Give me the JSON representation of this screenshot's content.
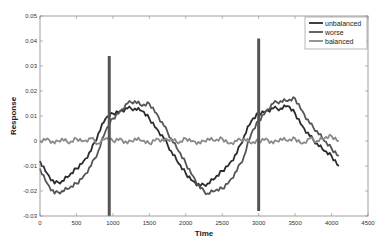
{
  "chart_data": {
    "type": "line",
    "title": "",
    "xlabel": "Time",
    "ylabel": "Response",
    "xlim": [
      0,
      4500
    ],
    "ylim": [
      -0.03,
      0.05
    ],
    "x_ticks": [
      0,
      500,
      1000,
      1500,
      2000,
      2500,
      3000,
      3500,
      4000,
      4500
    ],
    "y_ticks": [
      -0.03,
      -0.02,
      -0.01,
      0,
      0.01,
      0.02,
      0.03,
      0.04,
      0.05
    ],
    "x_tick_labels": [
      "0",
      "500",
      "1000",
      "1500",
      "2000",
      "2500",
      "3000",
      "3500",
      "4000",
      "4500"
    ],
    "y_tick_labels": [
      "-0.03",
      "-0.02",
      "-0.01",
      "0",
      "0.01",
      "0.02",
      "0.03",
      "0.04",
      "0.05"
    ],
    "grid": false,
    "legend_position": "upper right",
    "series": [
      {
        "name": "unbalanced",
        "color": "#2b2b2b",
        "x": [
          0,
          100,
          200,
          300,
          400,
          500,
          600,
          700,
          800,
          900,
          1000,
          1100,
          1200,
          1300,
          1400,
          1500,
          1600,
          1700,
          1800,
          1900,
          2000,
          2100,
          2200,
          2300,
          2400,
          2500,
          2600,
          2700,
          2800,
          2900,
          3000,
          3100,
          3200,
          3300,
          3400,
          3500,
          3600,
          3700,
          3800,
          3900,
          4000,
          4100
        ],
        "y": [
          -0.008,
          -0.013,
          -0.017,
          -0.016,
          -0.014,
          -0.011,
          -0.008,
          -0.004,
          0.003,
          0.009,
          0.011,
          0.012,
          0.013,
          0.013,
          0.012,
          0.009,
          0.005,
          0.001,
          -0.004,
          -0.009,
          -0.013,
          -0.016,
          -0.018,
          -0.017,
          -0.015,
          -0.012,
          -0.009,
          -0.005,
          0.002,
          0.008,
          0.011,
          0.012,
          0.013,
          0.013,
          0.014,
          0.011,
          0.006,
          0.002,
          -0.001,
          -0.004,
          -0.006,
          -0.01
        ]
      },
      {
        "name": "worse",
        "color": "#555555",
        "x": [
          0,
          100,
          200,
          300,
          400,
          500,
          600,
          700,
          800,
          900,
          1000,
          1100,
          1200,
          1300,
          1400,
          1500,
          1600,
          1700,
          1800,
          1900,
          2000,
          2100,
          2200,
          2300,
          2400,
          2500,
          2600,
          2700,
          2800,
          2900,
          3000,
          3100,
          3200,
          3300,
          3400,
          3500,
          3600,
          3700,
          3800,
          3900,
          4000,
          4100
        ],
        "y": [
          -0.011,
          -0.017,
          -0.021,
          -0.02,
          -0.019,
          -0.017,
          -0.014,
          -0.01,
          -0.004,
          0.004,
          0.009,
          0.012,
          0.015,
          0.016,
          0.014,
          0.015,
          0.011,
          0.006,
          0.001,
          -0.004,
          -0.009,
          -0.014,
          -0.019,
          -0.021,
          -0.02,
          -0.019,
          -0.016,
          -0.012,
          -0.006,
          0.003,
          0.008,
          0.012,
          0.015,
          0.016,
          0.016,
          0.017,
          0.012,
          0.007,
          0.004,
          0.0,
          -0.003,
          -0.006
        ]
      },
      {
        "name": "balanced",
        "color": "#8a8a8a",
        "x": [
          0,
          100,
          200,
          300,
          400,
          500,
          600,
          700,
          800,
          900,
          1000,
          1100,
          1200,
          1300,
          1400,
          1500,
          1600,
          1700,
          1800,
          1900,
          2000,
          2100,
          2200,
          2300,
          2400,
          2500,
          2600,
          2700,
          2800,
          2900,
          3000,
          3100,
          3200,
          3300,
          3400,
          3500,
          3600,
          3700,
          3800,
          3900,
          4000,
          4100
        ],
        "y": [
          0.0,
          0.001,
          -0.001,
          0.001,
          -0.001,
          0.001,
          0.0,
          0.001,
          -0.001,
          0.001,
          0.0,
          0.001,
          -0.001,
          0.001,
          0.0,
          -0.001,
          0.001,
          0.0,
          0.001,
          -0.001,
          0.001,
          0.0,
          -0.001,
          0.001,
          0.0,
          0.001,
          -0.001,
          0.0,
          0.001,
          -0.001,
          0.0,
          0.001,
          -0.001,
          0.001,
          0.0,
          0.001,
          -0.001,
          0.001,
          0.0,
          0.001,
          0.002,
          0.0
        ]
      }
    ],
    "annotations": [
      {
        "type": "spike",
        "x": 950,
        "y_top": 0.034,
        "y_bottom": -0.03
      },
      {
        "type": "spike",
        "x": 3000,
        "y_top": 0.041,
        "y_bottom": -0.028
      }
    ]
  }
}
